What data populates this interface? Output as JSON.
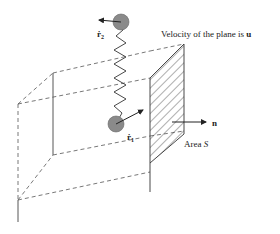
{
  "diagram": {
    "type": "physics-schematic",
    "labels": {
      "velocity_text": "Velocity of the plane is ",
      "velocity_symbol": "u",
      "normal_symbol": "n",
      "area_text": "Area ",
      "area_symbol": "S",
      "r1_symbol": "ṙ",
      "r1_sub": "1",
      "r2_symbol": "ṙ",
      "r2_sub": "2"
    },
    "colors": {
      "line": "#333333",
      "dashed": "#555555",
      "particle_fill": "#8a8a8a",
      "particle_stroke": "#555555"
    }
  }
}
